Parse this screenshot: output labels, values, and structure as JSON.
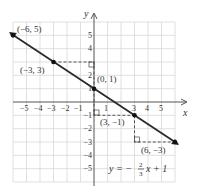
{
  "graph": {
    "equation_prefix": "y = −",
    "equation_frac_num": "2",
    "equation_frac_den": "3",
    "equation_suffix": "x + 1",
    "x_axis_label": "x",
    "y_axis_label": "y",
    "x_ticks": [
      "−5",
      "−4",
      "−3",
      "−2",
      "−1",
      "3",
      "4",
      "5"
    ],
    "x_tick_one": "1",
    "y_ticks": [
      "5",
      "4",
      "2",
      "1",
      "−1",
      "−2",
      "−3",
      "−4",
      "−5"
    ],
    "points": [
      {
        "label": "(−6, 5)",
        "x": -6,
        "y": 5
      },
      {
        "label": "(−3, 3)",
        "x": -3,
        "y": 3
      },
      {
        "label": "(0, 1)",
        "x": 0,
        "y": 1
      },
      {
        "label": "(3, −1)",
        "x": 3,
        "y": -1
      },
      {
        "label": "(6, −3)",
        "x": 6,
        "y": -3
      }
    ],
    "colors": {
      "grid": "#d8d8d8",
      "axis": "#555555",
      "line": "#2a2a2a",
      "point": "#111111"
    }
  }
}
